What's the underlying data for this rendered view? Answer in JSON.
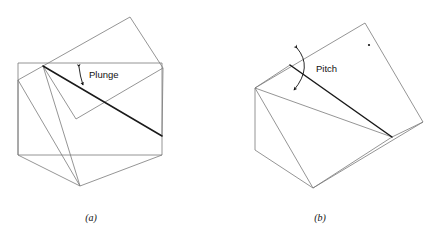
{
  "figure": {
    "panels": [
      {
        "id": "panel-a",
        "caption": "(a)",
        "annotation_label": "Plunge",
        "description": "Block diagram showing a tilted plane cutting a rectangular block; the angle between the horizontal reference line and the dipping lineation is the plunge.",
        "stroke_color_thin": "#7a7a7a",
        "stroke_color_thick": "#1a1a1a",
        "geometry": {
          "reference_rectangle": [
            [
              18,
              63
            ],
            [
              162,
              63
            ],
            [
              162,
              155
            ],
            [
              18,
              155
            ]
          ],
          "tilted_plane": [
            [
              43,
              66
            ],
            [
              130,
              17
            ],
            [
              163,
              68
            ],
            [
              76,
              119
            ]
          ],
          "block_outline": [
            [
              18,
              63
            ],
            [
              43,
              66
            ],
            [
              18,
              80
            ],
            [
              18,
              155
            ],
            [
              80,
              186
            ],
            [
              162,
              155
            ],
            [
              163,
              68
            ]
          ],
          "lineation_start": [
            43,
            66
          ],
          "lineation_end": [
            162,
            136
          ],
          "angle_arc_center": [
            43,
            66
          ]
        }
      },
      {
        "id": "panel-b",
        "caption": "(b)",
        "annotation_label": "Pitch",
        "description": "Block diagram showing an inclined plane; the angle measured within the plane between the strike line and the lineation is the pitch.",
        "stroke_color_thin": "#7a7a7a",
        "stroke_color_thick": "#1a1a1a",
        "geometry": {
          "top_face": [
            [
              255,
              88
            ],
            [
              290,
              65
            ],
            [
              365,
              23
            ],
            [
              423,
              122
            ],
            [
              392,
              137
            ]
          ],
          "front_face": [
            [
              255,
              88
            ],
            [
              255,
              150
            ],
            [
              313,
              188
            ],
            [
              392,
              137
            ]
          ],
          "lineation_start": [
            290,
            65
          ],
          "lineation_end": [
            392,
            137
          ],
          "strike_line_start": [
            255,
            88
          ],
          "strike_line_end": [
            365,
            23
          ],
          "dot": [
            369,
            45
          ]
        }
      }
    ]
  }
}
